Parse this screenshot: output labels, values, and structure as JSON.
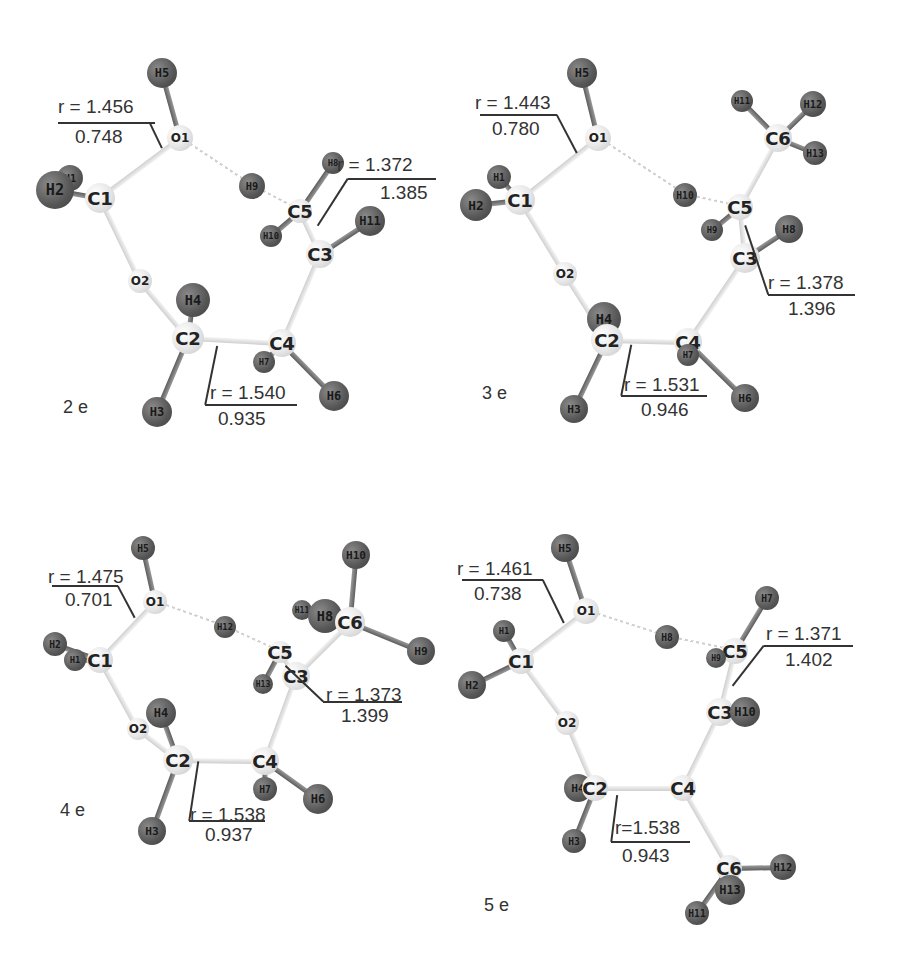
{
  "figure": {
    "panels": [
      {
        "id": "2e",
        "label": "2 e",
        "annotations": [
          {
            "bond": "O1-C1 (approx)",
            "r": "r = 1.456",
            "value": "0.748"
          },
          {
            "bond": "C5-C3",
            "r": "r = 1.372",
            "value": "1.385"
          },
          {
            "bond": "C2-C4",
            "r": "r = 1.540",
            "value": "0.935"
          }
        ],
        "atoms": [
          "H5",
          "O1",
          "H1",
          "H2",
          "C1",
          "H9",
          "H8",
          "C5",
          "H10",
          "C3",
          "H11",
          "O2",
          "H4",
          "C2",
          "C4",
          "H7",
          "H3",
          "H6"
        ]
      },
      {
        "id": "3e",
        "label": "3 e",
        "annotations": [
          {
            "bond": "O1-C1",
            "r": "r = 1.443",
            "value": "0.780"
          },
          {
            "bond": "C5-C3",
            "r": "r = 1.378",
            "value": "1.396"
          },
          {
            "bond": "C2-C4",
            "r": "r = 1.531",
            "value": "0.946"
          }
        ],
        "atoms": [
          "H5",
          "O1",
          "H11",
          "H12",
          "C6",
          "H13",
          "H1",
          "H2",
          "C1",
          "H10",
          "C5",
          "H9",
          "C3",
          "H8",
          "O2",
          "H4",
          "C2",
          "C4",
          "H7",
          "H3",
          "H6"
        ]
      },
      {
        "id": "4e",
        "label": "4 e",
        "annotations": [
          {
            "bond": "O1-C1",
            "r": "r = 1.475",
            "value": "0.701"
          },
          {
            "bond": "C5-C3",
            "r": "r = 1.373",
            "value": "1.399"
          },
          {
            "bond": "C2-C4",
            "r": "r = 1.538",
            "value": "0.937"
          }
        ],
        "atoms": [
          "H5",
          "O1",
          "H12",
          "H10",
          "H11",
          "H8",
          "C6",
          "H9",
          "H2",
          "H1",
          "C1",
          "C5",
          "H13",
          "C3",
          "O2",
          "H4",
          "C2",
          "C4",
          "H7",
          "H6",
          "H3"
        ]
      },
      {
        "id": "5e",
        "label": "5 e",
        "annotations": [
          {
            "bond": "O1-C1",
            "r": "r = 1.461",
            "value": "0.738"
          },
          {
            "bond": "C5-C3",
            "r": "r = 1.371",
            "value": "1.402"
          },
          {
            "bond": "C2-C4",
            "r": "r=1.538",
            "value": "0.943"
          }
        ],
        "atoms": [
          "H5",
          "O1",
          "H1",
          "C1",
          "H2",
          "H8",
          "H7",
          "C5",
          "H9",
          "C3",
          "H10",
          "O2",
          "H4",
          "C2",
          "C4",
          "H3",
          "C6",
          "H12",
          "H13",
          "H11"
        ]
      }
    ],
    "colors": {
      "heavy_atom": "#e6e6e6",
      "hydrogen_atom": "#555555",
      "text": "#333333",
      "bond": "#d8d8d8"
    }
  }
}
